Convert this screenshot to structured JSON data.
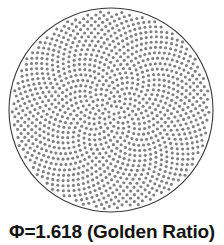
{
  "figure": {
    "caption": "Φ=1.618 (Golden Ratio)",
    "background_color": "#ffffff",
    "caption_color": "#131313"
  },
  "chart_data": {
    "type": "scatter",
    "title": "Φ=1.618 (Golden Ratio)",
    "subtitle": "",
    "xlabel": "",
    "ylabel": "",
    "annotations": [
      "Φ=1.618 (Golden Ratio)"
    ],
    "legend": [],
    "legend_position": "none",
    "grid": false,
    "axis_visible": false,
    "xlim": [
      -1,
      1
    ],
    "ylim": [
      -1,
      1
    ],
    "pattern": "vogel-phyllotaxis",
    "golden_ratio": 1.618,
    "golden_angle_degrees": 137.507764,
    "point_count": 1150,
    "radius_exponent": 0.5,
    "point_color": "#808080",
    "point_diameter_px": 3.1,
    "boundary": {
      "shape": "circle",
      "center_x_px": 111,
      "center_y_px": 110,
      "radius_px": 102,
      "stroke_color": "#3a3a3a",
      "stroke_width_px": 1.1,
      "fill": "none"
    }
  }
}
